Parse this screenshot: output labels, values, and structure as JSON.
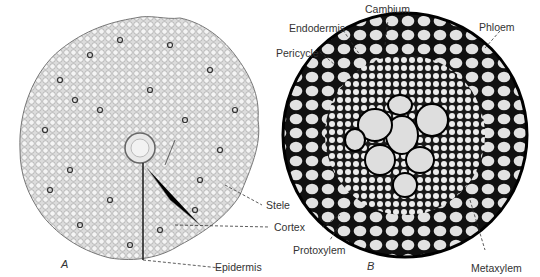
{
  "figure": {
    "panels": [
      {
        "id": "A",
        "letter": "A",
        "description": "Cross-section of root, low magnification"
      },
      {
        "id": "B",
        "letter": "B",
        "description": "Enlarged stele cross-section"
      }
    ],
    "labels": {
      "cambium": "Cambium",
      "endodermis": "Endodermis",
      "pericycle": "Pericycle",
      "phloem": "Phloem",
      "stele": "Stele",
      "cortex": "Cortex",
      "protoxylem": "Protoxylem",
      "epidermis": "Epidermis",
      "metaxylem": "Metaxylem"
    },
    "colors": {
      "background": "#ffffff",
      "tissue_light": "#e4e4e4",
      "tissue_dark": "#1a1a1a",
      "label_text": "#333333"
    }
  }
}
